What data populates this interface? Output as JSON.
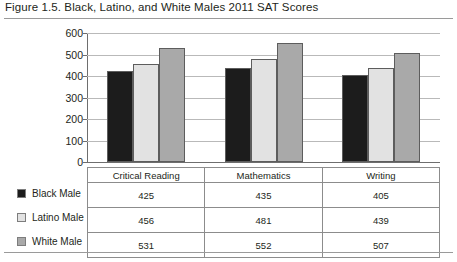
{
  "figure": {
    "title": "Figure 1.5. Black, Latino, and White Males 2011 SAT Scores"
  },
  "chart_data": {
    "type": "bar",
    "title": "Figure 1.5. Black, Latino, and White Males 2011 SAT Scores",
    "xlabel": "",
    "ylabel": "",
    "ylim": [
      0,
      600
    ],
    "yticks": [
      0,
      100,
      200,
      300,
      400,
      500,
      600
    ],
    "ytick_labels": [
      "0",
      "100",
      "200",
      "300",
      "400",
      "500",
      "600"
    ],
    "grid": true,
    "legend_position": "left-table",
    "categories": [
      "Critical Reading",
      "Mathematics",
      "Writing"
    ],
    "series": [
      {
        "name": "Black Male",
        "color": "#1c1c1c",
        "values": [
          425,
          435,
          405
        ]
      },
      {
        "name": "Latino Male",
        "color": "#e2e2e2",
        "values": [
          456,
          481,
          439
        ]
      },
      {
        "name": "White Male",
        "color": "#a9a9a9",
        "values": [
          531,
          552,
          507
        ]
      }
    ]
  },
  "table": {
    "corner_label": "",
    "headers": [
      "Critical Reading",
      "Mathematics",
      "Writing"
    ],
    "rows": [
      {
        "label": "Black Male",
        "values": [
          "425",
          "435",
          "405"
        ]
      },
      {
        "label": "Latino Male",
        "values": [
          "456",
          "481",
          "439"
        ]
      },
      {
        "label": "White Male",
        "values": [
          "531",
          "552",
          "507"
        ]
      }
    ]
  }
}
